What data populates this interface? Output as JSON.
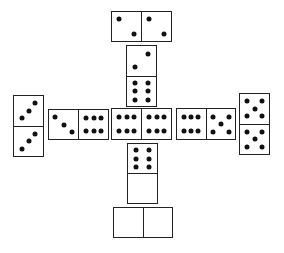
{
  "game": "dominoes",
  "board": {
    "background": "#ffffff",
    "pip_color": "#111111",
    "line_color": "#222222",
    "tiles": [
      {
        "id": "top-2-2",
        "orientation": "h",
        "values": [
          2,
          2
        ],
        "x": 111,
        "y": 11,
        "w": 61,
        "h": 31
      },
      {
        "id": "upper-2-6",
        "orientation": "v",
        "values": [
          2,
          6
        ],
        "x": 126,
        "y": 45,
        "w": 31,
        "h": 62
      },
      {
        "id": "left-3-3",
        "orientation": "v",
        "values": [
          3,
          3
        ],
        "x": 13,
        "y": 95,
        "w": 31,
        "h": 62
      },
      {
        "id": "left-3-6",
        "orientation": "h",
        "values": [
          3,
          6
        ],
        "x": 48,
        "y": 109,
        "w": 61,
        "h": 31
      },
      {
        "id": "center-6-6",
        "orientation": "h",
        "values": [
          6,
          6
        ],
        "x": 111,
        "y": 108,
        "w": 61,
        "h": 32
      },
      {
        "id": "right-6-5",
        "orientation": "h",
        "values": [
          6,
          5
        ],
        "x": 176,
        "y": 108,
        "w": 60,
        "h": 32
      },
      {
        "id": "right-5-5",
        "orientation": "v",
        "values": [
          5,
          5
        ],
        "x": 239,
        "y": 93,
        "w": 31,
        "h": 62
      },
      {
        "id": "lower-6-0",
        "orientation": "v",
        "values": [
          6,
          0
        ],
        "x": 127,
        "y": 143,
        "w": 31,
        "h": 61
      },
      {
        "id": "bottom-0-0",
        "orientation": "h",
        "values": [
          0,
          0
        ],
        "x": 113,
        "y": 207,
        "w": 60,
        "h": 31
      }
    ]
  }
}
